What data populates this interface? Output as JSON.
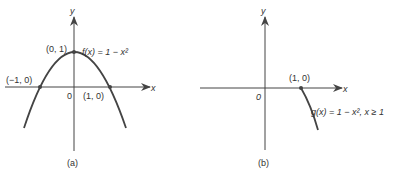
{
  "panels": [
    {
      "id": "a",
      "caption": "(a)",
      "axis_x_label": "x",
      "axis_y_label": "y",
      "origin_label": "0",
      "function_label": "f(x) = 1 − x²",
      "points": [
        {
          "label": "(0, 1)",
          "x": 0,
          "y": 1
        },
        {
          "label": "(−1, 0)",
          "x": -1,
          "y": 0
        },
        {
          "label": "(1, 0)",
          "x": 1,
          "y": 0
        }
      ]
    },
    {
      "id": "b",
      "caption": "(b)",
      "axis_x_label": "x",
      "axis_y_label": "y",
      "origin_label": "0",
      "function_label": "g(x) = 1 − x², x ≥ 1",
      "points": [
        {
          "label": "(1, 0)",
          "x": 1,
          "y": 0
        }
      ]
    }
  ],
  "colors": {
    "line": "#444444",
    "text": "#333333",
    "background": "#ffffff"
  }
}
